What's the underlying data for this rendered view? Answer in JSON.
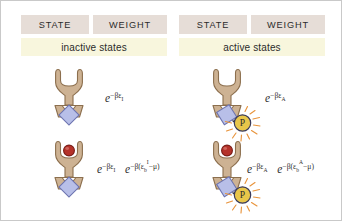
{
  "figure": {
    "columns": [
      {
        "id": "inactive",
        "band_label": "inactive states",
        "state_header": "STATE",
        "weight_header": "WEIGHT"
      },
      {
        "id": "active",
        "band_label": "active states",
        "state_header": "STATE",
        "weight_header": "WEIGHT"
      }
    ],
    "weights": {
      "inactive_unbound": {
        "terms": [
          {
            "base": "e",
            "exp_minus": "−",
            "exp_beta": "βε",
            "exp_sub": "I",
            "exp_sup": ""
          }
        ],
        "plain": "e−βεI"
      },
      "inactive_bound": {
        "plain": "e−βεI e−β(εbI−μ)"
      },
      "active_unbound": {
        "plain": "e−βεA"
      },
      "active_bound": {
        "plain": "e−βεA e−β(εbA−μ)"
      }
    },
    "symbols": {
      "e": "e",
      "minus": "−",
      "beta": "β",
      "epsilon": "ε",
      "mu": "μ",
      "paren_open": "(",
      "paren_close": ")",
      "sub_b": "b",
      "state_I": "I",
      "state_A": "A"
    },
    "glyphs": {
      "phosphate_label": "P"
    },
    "colors": {
      "header_bar": "#e6ddd7",
      "band_bar": "#f8f6dd",
      "receptor_fill": "#cdb293",
      "receptor_stroke": "#8c6f4e",
      "domain_fill": "#b8bfe8",
      "domain_stroke": "#6d74b0",
      "ligand_fill": "#b5322a",
      "ligand_stroke": "#7a1d17",
      "phosphate_fill": "#e8c64a",
      "phosphate_stroke": "#3a3a5a",
      "ray_stroke": "#e8943c",
      "border": "#c9c9c9",
      "text": "#2b2b2b"
    }
  }
}
